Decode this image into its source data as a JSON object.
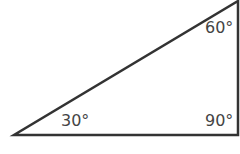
{
  "figure": {
    "type": "right-triangle",
    "stroke_color": "#333333",
    "fill_color": "#ffffff",
    "vertices": {
      "bottom_left": {
        "x": 14,
        "y": 135
      },
      "bottom_right": {
        "x": 238,
        "y": 135
      },
      "top_right": {
        "x": 238,
        "y": 1
      }
    },
    "angles": [
      {
        "id": "bottom-left",
        "label": "30°"
      },
      {
        "id": "top-right",
        "label": "60°"
      },
      {
        "id": "bottom-right",
        "label": "90°"
      }
    ]
  }
}
